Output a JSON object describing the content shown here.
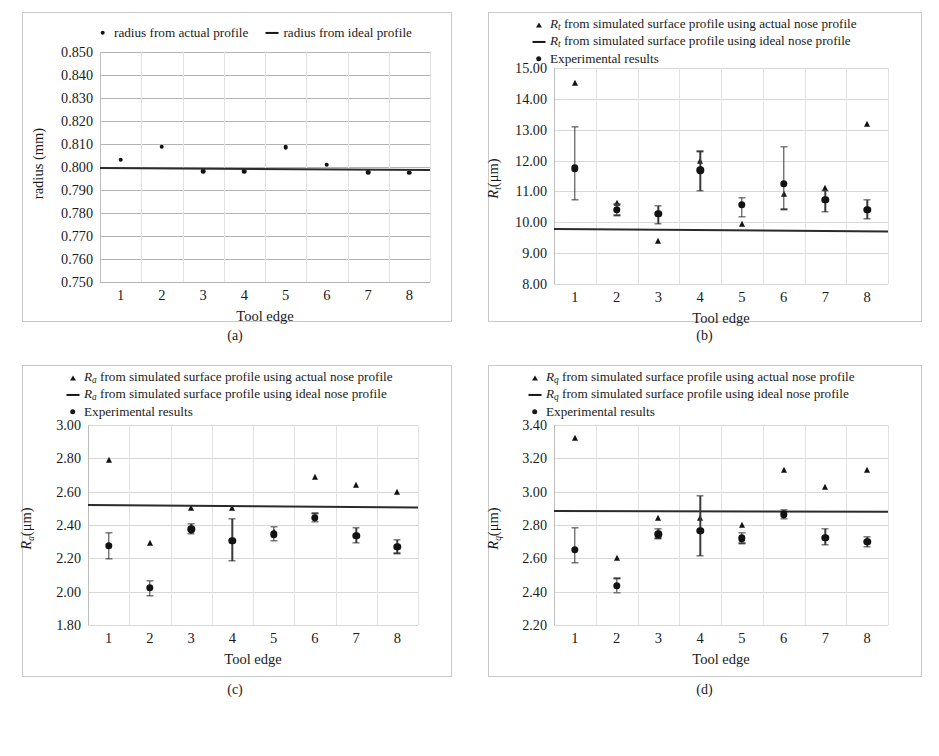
{
  "figure": {
    "panels": [
      {
        "caption": "(a)",
        "xlabel": "Tool edge",
        "ylabel_main": "radius (mm)",
        "ylabel_sub": "",
        "legend": [
          {
            "marker": "dot",
            "text": "radius from actual profile"
          },
          {
            "marker": "line",
            "text": "radius from ideal profile"
          }
        ],
        "yticks": [
          "0.850",
          "0.840",
          "0.830",
          "0.820",
          "0.810",
          "0.800",
          "0.790",
          "0.780",
          "0.770",
          "0.760",
          "0.750"
        ],
        "xticks": [
          "1",
          "2",
          "3",
          "4",
          "5",
          "6",
          "7",
          "8"
        ]
      },
      {
        "caption": "(b)",
        "xlabel": "Tool edge",
        "ylabel_main": "R",
        "ylabel_sub": "t",
        "ylabel_unit": "(μm)",
        "legend": [
          {
            "marker": "tri",
            "sym": "R",
            "sub": "t",
            "text": " from simulated surface profile using actual nose profile"
          },
          {
            "marker": "line",
            "sym": "R",
            "sub": "t",
            "text": " from simulated surface profile using ideal nose profile"
          },
          {
            "marker": "dotbig",
            "sym": "",
            "sub": "",
            "text": "Experimental results"
          }
        ],
        "yticks": [
          "15.00",
          "14.00",
          "13.00",
          "12.00",
          "11.00",
          "10.00",
          "9.00",
          "8.00"
        ],
        "xticks": [
          "1",
          "2",
          "3",
          "4",
          "5",
          "6",
          "7",
          "8"
        ]
      },
      {
        "caption": "(c)",
        "xlabel": "Tool edge",
        "ylabel_main": "R",
        "ylabel_sub": "a",
        "ylabel_unit": "(μm)",
        "legend": [
          {
            "marker": "tri",
            "sym": "R",
            "sub": "a",
            "text": " from simulated surface profile using actual nose profile"
          },
          {
            "marker": "line",
            "sym": "R",
            "sub": "a",
            "text": " from simulated surface profile using ideal nose profile"
          },
          {
            "marker": "dotbig",
            "sym": "",
            "sub": "",
            "text": "Experimental results"
          }
        ],
        "yticks": [
          "3.00",
          "2.80",
          "2.60",
          "2.40",
          "2.20",
          "2.00",
          "1.80"
        ],
        "xticks": [
          "1",
          "2",
          "3",
          "4",
          "5",
          "6",
          "7",
          "8"
        ]
      },
      {
        "caption": "(d)",
        "xlabel": "Tool edge",
        "ylabel_main": "R",
        "ylabel_sub": "q",
        "ylabel_unit": "(μm)",
        "legend": [
          {
            "marker": "tri",
            "sym": "R",
            "sub": "q",
            "text": " from simulated surface profile using actual nose profile"
          },
          {
            "marker": "line",
            "sym": "R",
            "sub": "q",
            "text": " from simulated surface profile using ideal nose profile"
          },
          {
            "marker": "dotbig",
            "sym": "",
            "sub": "",
            "text": "Experimental results"
          }
        ],
        "yticks": [
          "3.40",
          "3.20",
          "3.00",
          "2.80",
          "2.60",
          "2.40",
          "2.20"
        ],
        "xticks": [
          "1",
          "2",
          "3",
          "4",
          "5",
          "6",
          "7",
          "8"
        ]
      }
    ]
  },
  "chart_data": [
    {
      "panel": "(a)",
      "type": "scatter",
      "title": "",
      "xlabel": "Tool edge",
      "ylabel": "radius (mm)",
      "categories": [
        "1",
        "2",
        "3",
        "4",
        "5",
        "6",
        "7",
        "8"
      ],
      "xlim": [
        0.5,
        8.5
      ],
      "ylim": [
        0.75,
        0.85
      ],
      "ytick_step": 0.01,
      "grid": true,
      "legend_position": "top",
      "series": [
        {
          "name": "radius from actual profile",
          "marker": "dot",
          "values": [
            0.8032,
            0.8088,
            0.7982,
            0.7982,
            0.8086,
            0.801,
            0.7977,
            0.7975
          ]
        },
        {
          "name": "radius from ideal profile",
          "marker": "line",
          "line_start": 0.8002,
          "line_end": 0.7993
        }
      ]
    },
    {
      "panel": "(b)",
      "type": "scatter",
      "title": "",
      "xlabel": "Tool edge",
      "ylabel": "Rt(μm)",
      "categories": [
        "1",
        "2",
        "3",
        "4",
        "5",
        "6",
        "7",
        "8"
      ],
      "xlim": [
        0.5,
        8.5
      ],
      "ylim": [
        8.0,
        15.0
      ],
      "ytick_step": 1.0,
      "grid": true,
      "legend_position": "top",
      "series": [
        {
          "name": "Rt from simulated surface profile using actual nose profile",
          "marker": "triangle",
          "values": [
            14.5,
            10.62,
            9.38,
            12.0,
            9.96,
            10.93,
            11.1,
            13.2
          ]
        },
        {
          "name": "Rt from simulated surface profile using ideal nose profile",
          "marker": "line",
          "line_start": 9.82,
          "line_end": 9.74
        },
        {
          "name": "Experimental results",
          "marker": "circle",
          "values": [
            11.75,
            10.4,
            10.28,
            11.68,
            10.57,
            11.25,
            10.72,
            10.4
          ],
          "err_low": [
            10.72,
            10.22,
            9.96,
            11.02,
            10.18,
            10.42,
            10.33,
            10.1
          ],
          "err_high": [
            13.1,
            10.58,
            10.53,
            12.3,
            10.8,
            12.45,
            11.02,
            10.72
          ]
        }
      ]
    },
    {
      "panel": "(c)",
      "type": "scatter",
      "title": "",
      "xlabel": "Tool edge",
      "ylabel": "Ra(μm)",
      "categories": [
        "1",
        "2",
        "3",
        "4",
        "5",
        "6",
        "7",
        "8"
      ],
      "xlim": [
        0.5,
        8.5
      ],
      "ylim": [
        1.8,
        3.0
      ],
      "ytick_step": 0.2,
      "grid": true,
      "legend_position": "top",
      "series": [
        {
          "name": "Ra from simulated surface profile using actual nose profile",
          "marker": "triangle",
          "values": [
            2.79,
            2.29,
            2.5,
            2.5,
            2.36,
            2.69,
            2.64,
            2.6
          ]
        },
        {
          "name": "Ra from simulated surface profile using ideal nose profile",
          "marker": "line",
          "line_start": 2.525,
          "line_end": 2.51
        },
        {
          "name": "Experimental results",
          "marker": "circle",
          "values": [
            2.275,
            2.025,
            2.375,
            2.305,
            2.345,
            2.445,
            2.335,
            2.27
          ],
          "err_low": [
            2.195,
            1.975,
            2.345,
            2.185,
            2.305,
            2.42,
            2.295,
            2.23
          ],
          "err_high": [
            2.355,
            2.065,
            2.405,
            2.435,
            2.39,
            2.47,
            2.385,
            2.31
          ]
        }
      ]
    },
    {
      "panel": "(d)",
      "type": "scatter",
      "title": "",
      "xlabel": "Tool edge",
      "ylabel": "Rq(μm)",
      "categories": [
        "1",
        "2",
        "3",
        "4",
        "5",
        "6",
        "7",
        "8"
      ],
      "xlim": [
        0.5,
        8.5
      ],
      "ylim": [
        2.2,
        3.4
      ],
      "ytick_step": 0.2,
      "grid": true,
      "legend_position": "top",
      "series": [
        {
          "name": "Rq from simulated surface profile using actual nose profile",
          "marker": "triangle",
          "values": [
            3.32,
            2.6,
            2.84,
            2.84,
            2.8,
            3.13,
            3.03,
            3.13
          ]
        },
        {
          "name": "Rq from simulated surface profile using ideal nose profile",
          "marker": "line",
          "line_start": 2.89,
          "line_end": 2.885
        },
        {
          "name": "Experimental results",
          "marker": "circle",
          "values": [
            2.65,
            2.435,
            2.745,
            2.765,
            2.72,
            2.865,
            2.725,
            2.7
          ],
          "err_low": [
            2.575,
            2.395,
            2.72,
            2.615,
            2.69,
            2.835,
            2.68,
            2.67
          ],
          "err_high": [
            2.785,
            2.48,
            2.775,
            2.975,
            2.755,
            2.89,
            2.775,
            2.73
          ]
        }
      ]
    }
  ]
}
